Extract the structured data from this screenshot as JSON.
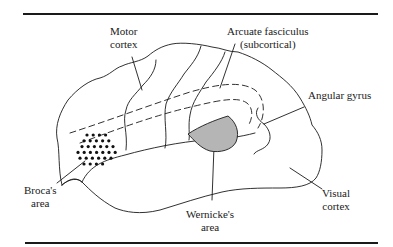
{
  "figure": {
    "colors": {
      "line": "#1a1a1a",
      "wernicke_fill": "#b5b5b5",
      "background": "#ffffff"
    }
  },
  "labels": {
    "motor_cortex": {
      "line1": "Motor",
      "line2": "cortex"
    },
    "arcuate_fasciculus": {
      "line1": "Arcuate fasciculus",
      "line2": "(subcortical)"
    },
    "angular_gyrus": {
      "line1": "Angular gyrus"
    },
    "brocas_area": {
      "line1": "Broca's",
      "line2": "area"
    },
    "wernickes_area": {
      "line1": "Wernicke's",
      "line2": "area"
    },
    "visual_cortex": {
      "line1": "Visual",
      "line2": "cortex"
    }
  },
  "brocas_dots": {
    "rows": [
      4,
      5,
      6,
      7,
      6,
      4
    ]
  }
}
